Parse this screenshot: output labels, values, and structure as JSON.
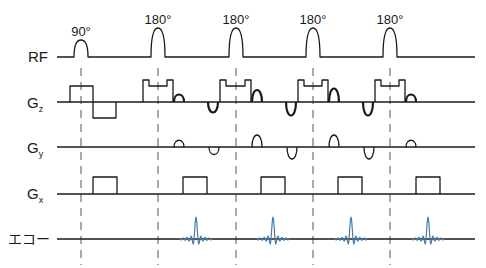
{
  "diagram": {
    "type": "MRI pulse sequence (fast spin echo)",
    "rows": [
      {
        "id": "rf",
        "label": "RF",
        "sub": ""
      },
      {
        "id": "gz",
        "label": "G",
        "sub": "z"
      },
      {
        "id": "gy",
        "label": "G",
        "sub": "y"
      },
      {
        "id": "gx",
        "label": "G",
        "sub": "x"
      },
      {
        "id": "echo",
        "label": "エコー",
        "sub": ""
      }
    ],
    "pulses": [
      {
        "label": "90°",
        "kind": "excitation"
      },
      {
        "label": "180°",
        "kind": "refocusing"
      },
      {
        "label": "180°",
        "kind": "refocusing"
      },
      {
        "label": "180°",
        "kind": "refocusing"
      },
      {
        "label": "180°",
        "kind": "refocusing"
      }
    ],
    "echo_count": 4,
    "phase_encode_amplitudes": [
      0.5,
      1.0,
      1.0,
      0.5
    ],
    "colors": {
      "trace": "#1a1a1a",
      "echo": "#4a7ca8",
      "dash": "#555555"
    }
  }
}
